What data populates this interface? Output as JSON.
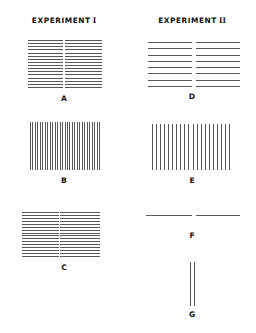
{
  "figure": {
    "width": 256,
    "height": 333,
    "background": "#ffffff",
    "line_color": "#585858",
    "text_color": "#111111"
  },
  "columns": [
    {
      "id": "experiment-1",
      "header_text": "EXPERIMENT",
      "header_numeral": "I",
      "panels": [
        "A",
        "B",
        "C"
      ]
    },
    {
      "id": "experiment-2",
      "header_text": "EXPERIMENT",
      "header_numeral": "II",
      "panels": [
        "D",
        "E",
        "F",
        "G"
      ]
    }
  ],
  "panels": [
    {
      "id": "A",
      "label": "A",
      "column": "experiment-1",
      "orientation": "horizontal",
      "line_count": 16,
      "divider": "vertical",
      "x": 28,
      "y": 40,
      "width": 74,
      "height": 48,
      "label_y": 94,
      "divider_offset": 35,
      "divider_width": 2
    },
    {
      "id": "B",
      "label": "B",
      "column": "experiment-1",
      "orientation": "vertical",
      "line_count": 29,
      "divider": "none",
      "x": 30,
      "y": 122,
      "width": 70,
      "height": 48,
      "label_y": 176,
      "divider_offset": 0,
      "divider_width": 0
    },
    {
      "id": "C",
      "label": "C",
      "column": "experiment-1",
      "orientation": "horizontal",
      "line_count": 16,
      "divider": "vertical",
      "x": 22,
      "y": 212,
      "width": 78,
      "height": 45,
      "label_y": 263,
      "divider_offset": 37,
      "divider_width": 1
    },
    {
      "id": "D",
      "label": "D",
      "column": "experiment-2",
      "orientation": "horizontal",
      "line_count": 8,
      "divider": "vertical",
      "x": 148,
      "y": 42,
      "width": 92,
      "height": 45,
      "label_y": 92,
      "divider_offset": 44,
      "divider_width": 4
    },
    {
      "id": "E",
      "label": "E",
      "column": "experiment-2",
      "orientation": "vertical",
      "line_count": 20,
      "divider": "none",
      "x": 152,
      "y": 124,
      "width": 78,
      "height": 46,
      "label_y": 176,
      "divider_offset": 0,
      "divider_width": 0
    },
    {
      "id": "F",
      "label": "F",
      "column": "experiment-2",
      "orientation": "horizontal",
      "line_count": 1,
      "divider": "vertical",
      "x": 146,
      "y": 215,
      "width": 94,
      "height": 4,
      "label_y": 231,
      "divider_offset": 46,
      "divider_width": 4
    },
    {
      "id": "G",
      "label": "G",
      "column": "experiment-2",
      "orientation": "vertical",
      "line_count": 2,
      "divider": "none",
      "x": 190,
      "y": 262,
      "width": 5,
      "height": 44,
      "label_y": 310,
      "divider_offset": 0,
      "divider_width": 0
    }
  ]
}
